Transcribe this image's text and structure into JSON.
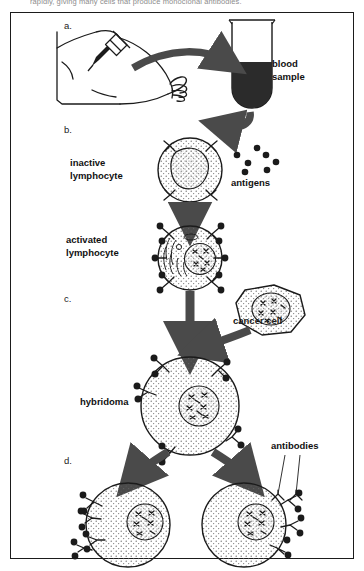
{
  "caption": {
    "text": "rapidly, giving many cells that produce monoclonal antibodies."
  },
  "diagram": {
    "title_semantic": "monoclonal-antibody-production",
    "steps": [
      {
        "id": "a",
        "letter": "a."
      },
      {
        "id": "b",
        "letter": "b."
      },
      {
        "id": "c",
        "letter": "c."
      },
      {
        "id": "d",
        "letter": "d."
      }
    ],
    "labels": {
      "blood_sample": "blood\nsample",
      "inactive_lymphocyte": "inactive\nlymphocyte",
      "antigens": "antigens",
      "activated_lymphocyte": "activated\nlymphocyte",
      "cancer_cell": "cancer cell",
      "hybridoma": "hybridoma",
      "antibodies": "antibodies"
    },
    "colors": {
      "ink": "#1b1b1b",
      "arrow": "#4a4a4a",
      "blood": "#2b2b2b",
      "stipple": "#6f6f6f",
      "frame": "#1b1b1b",
      "caption": "#8d8d8d"
    },
    "counts": {
      "antigen_dots": 7,
      "inactive_receptors": 4,
      "activated_receptors": 6,
      "daughter_cells": 2,
      "free_antibodies": 2
    }
  }
}
